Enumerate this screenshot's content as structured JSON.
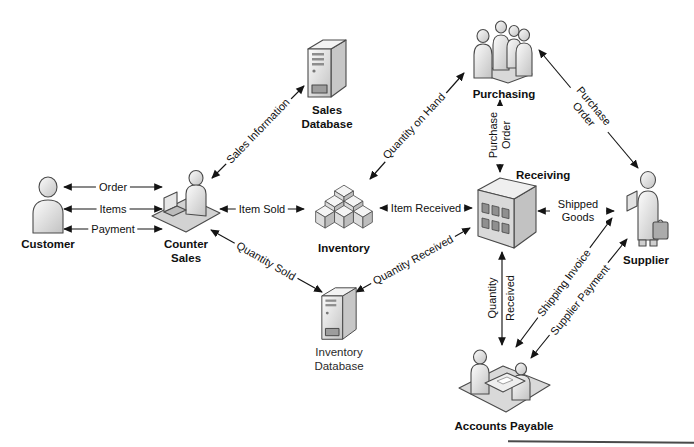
{
  "diagram": {
    "nodes": [
      {
        "id": "customer",
        "label": "Customer",
        "icon": "person-icon"
      },
      {
        "id": "counter_sales",
        "label": "Counter Sales",
        "icon": "person-at-desk-icon"
      },
      {
        "id": "sales_database",
        "label": "Sales Database",
        "icon": "database-server-icon"
      },
      {
        "id": "purchasing",
        "label": "Purchasing",
        "icon": "people-group-icon"
      },
      {
        "id": "inventory",
        "label": "Inventory",
        "icon": "stacked-boxes-icon"
      },
      {
        "id": "receiving",
        "label": "Receiving",
        "icon": "warehouse-building-icon"
      },
      {
        "id": "supplier",
        "label": "Supplier",
        "icon": "person-with-briefcase-icon"
      },
      {
        "id": "inventory_database",
        "label": "Inventory Database",
        "icon": "database-server-icon"
      },
      {
        "id": "accounts_payable",
        "label": "Accounts Payable",
        "icon": "people-at-table-icon"
      }
    ],
    "edges": [
      {
        "label": "Order",
        "from": "customer",
        "to": "counter_sales",
        "direction": "both"
      },
      {
        "label": "Items",
        "from": "customer",
        "to": "counter_sales",
        "direction": "both"
      },
      {
        "label": "Payment",
        "from": "customer",
        "to": "counter_sales",
        "direction": "both"
      },
      {
        "label": "Sales Information",
        "from": "counter_sales",
        "to": "sales_database",
        "direction": "both"
      },
      {
        "label": "Item Sold",
        "from": "counter_sales",
        "to": "inventory",
        "direction": "both"
      },
      {
        "label": "Quantity Sold",
        "from": "counter_sales",
        "to": "inventory_database",
        "direction": "both"
      },
      {
        "label": "Quantity on Hand",
        "from": "inventory",
        "to": "purchasing",
        "direction": "both"
      },
      {
        "label": "Item Received",
        "from": "inventory",
        "to": "receiving",
        "direction": "both"
      },
      {
        "label": "Purchase Order",
        "from": "receiving",
        "to": "purchasing",
        "direction": "both"
      },
      {
        "label": "Purchase Order",
        "from": "purchasing",
        "to": "supplier",
        "direction": "both"
      },
      {
        "label": "Quantity Received",
        "from": "inventory_database",
        "to": "receiving",
        "direction": "both"
      },
      {
        "label": "Quantity Received",
        "from": "receiving",
        "to": "accounts_payable",
        "direction": "both"
      },
      {
        "label": "Shipped Goods",
        "from": "receiving",
        "to": "supplier",
        "direction": "both"
      },
      {
        "label": "Shipping Invoice",
        "from": "supplier",
        "to": "accounts_payable",
        "direction": "both"
      },
      {
        "label": "Supplier Payment",
        "from": "accounts_payable",
        "to": "supplier",
        "direction": "both"
      }
    ],
    "colors": {
      "line": "#141414",
      "icon_fill_light": "#e9e9e9",
      "icon_fill_dark": "#bdbdbd",
      "background": "#ffffff"
    }
  }
}
